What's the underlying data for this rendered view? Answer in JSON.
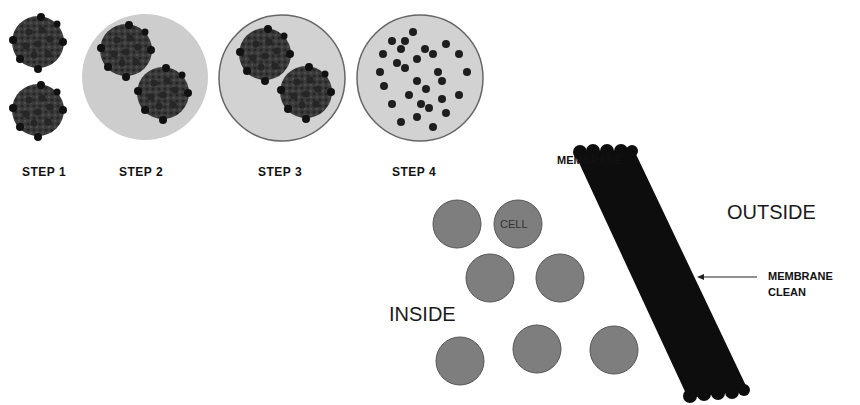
{
  "steps": [
    {
      "label": "STEP 1"
    },
    {
      "label": "STEP 2"
    },
    {
      "label": "STEP 3"
    },
    {
      "label": "STEP 4"
    }
  ],
  "membrane_diagram": {
    "membrane_label": "MEMBRANE",
    "outside_label": "OUTSIDE",
    "inside_label": "INSIDE",
    "cell_label": "CELL",
    "annotation_line1": "MEMBRANE",
    "annotation_line2": "CLEAN"
  },
  "colors": {
    "cluster": "#3a3a3a",
    "cluster_dot": "#1a1a1a",
    "fluid": "#cfcfcf",
    "cell": "#7d7d7d",
    "membrane": "#0d0d0d"
  }
}
